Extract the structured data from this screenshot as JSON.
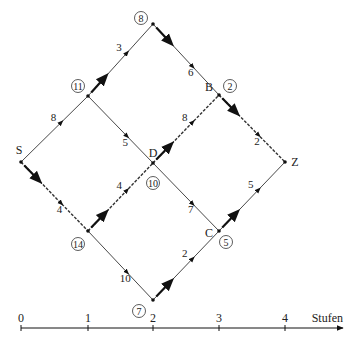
{
  "diagram": {
    "type": "network-stage-graph",
    "nodes": [
      {
        "id": "S",
        "label": "S",
        "x": 21,
        "y": 162,
        "circle_value": null
      },
      {
        "id": "N11",
        "label": "",
        "x": 88,
        "y": 96,
        "circle_value": "11"
      },
      {
        "id": "N14",
        "label": "",
        "x": 88,
        "y": 231,
        "circle_value": "14"
      },
      {
        "id": "N8",
        "label": "",
        "x": 153,
        "y": 24,
        "circle_value": "8"
      },
      {
        "id": "D",
        "label": "D",
        "x": 153,
        "y": 163,
        "circle_value": "10"
      },
      {
        "id": "N7",
        "label": "",
        "x": 153,
        "y": 300,
        "circle_value": "7"
      },
      {
        "id": "B",
        "label": "B",
        "x": 219,
        "y": 95,
        "circle_value": "2"
      },
      {
        "id": "C",
        "label": "C",
        "x": 219,
        "y": 231,
        "circle_value": "5"
      },
      {
        "id": "Z",
        "label": "Z",
        "x": 285,
        "y": 162,
        "circle_value": null
      }
    ],
    "edges": [
      {
        "from": "S",
        "to": "N11",
        "weight": "8",
        "optimal": false
      },
      {
        "from": "S",
        "to": "N14",
        "weight": "4",
        "optimal": true
      },
      {
        "from": "N11",
        "to": "N8",
        "weight": "3",
        "optimal": false
      },
      {
        "from": "N11",
        "to": "D",
        "weight": "5",
        "optimal": false
      },
      {
        "from": "N14",
        "to": "D",
        "weight": "4",
        "optimal": true
      },
      {
        "from": "N14",
        "to": "N7",
        "weight": "10",
        "optimal": false
      },
      {
        "from": "N8",
        "to": "B",
        "weight": "6",
        "optimal": false
      },
      {
        "from": "D",
        "to": "B",
        "weight": "8",
        "optimal": true
      },
      {
        "from": "D",
        "to": "C",
        "weight": "7",
        "optimal": false
      },
      {
        "from": "N7",
        "to": "C",
        "weight": "2",
        "optimal": false
      },
      {
        "from": "B",
        "to": "Z",
        "weight": "2",
        "optimal": true
      },
      {
        "from": "C",
        "to": "Z",
        "weight": "5",
        "optimal": false
      }
    ],
    "axis": {
      "label": "Stufen",
      "ticks": [
        "0",
        "1",
        "2",
        "3",
        "4"
      ]
    }
  }
}
